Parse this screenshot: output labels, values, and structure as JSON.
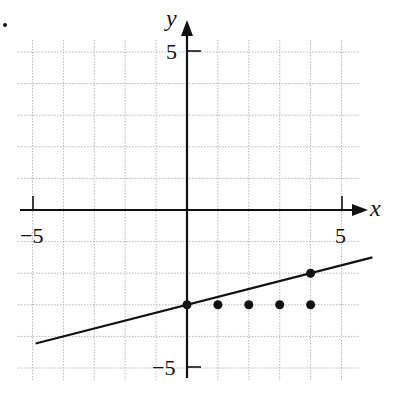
{
  "chart_data": {
    "type": "line",
    "title": "",
    "xlabel": "x",
    "ylabel": "y",
    "xlim": [
      -5.5,
      6
    ],
    "ylim": [
      -5.5,
      5.7
    ],
    "grid": true,
    "x_ticks_labeled": [
      -5,
      5
    ],
    "y_ticks_labeled": [
      5,
      -5
    ],
    "tick_labels": {
      "x_neg": "−5",
      "x_pos": "5",
      "y_pos": "5",
      "y_neg": "−5"
    },
    "series": [
      {
        "name": "line",
        "kind": "line",
        "equation": "y = x/4 - 3",
        "x": [
          -4.9,
          6
        ],
        "y": [
          -4.225,
          -1.5
        ]
      },
      {
        "name": "line points",
        "kind": "scatter",
        "x": [
          0,
          4
        ],
        "y": [
          -3,
          -2
        ]
      },
      {
        "name": "horizontal points",
        "kind": "scatter",
        "x": [
          1,
          2,
          3,
          4
        ],
        "y": [
          -3,
          -3,
          -3,
          -3
        ]
      }
    ]
  },
  "labels": {
    "x_axis": "x",
    "y_axis": "y",
    "x_neg": "−5",
    "x_pos": "5",
    "y_pos": "5",
    "y_neg": "−5"
  }
}
